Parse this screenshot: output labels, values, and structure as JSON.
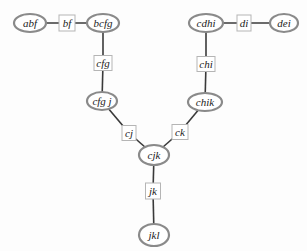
{
  "diagram": {
    "type": "junction-tree",
    "clusters": [
      {
        "id": "abf",
        "label": "abf",
        "cx": 30,
        "cy": 23,
        "rx": 16,
        "ry": 9
      },
      {
        "id": "bcfg",
        "label": "bcfg",
        "cx": 103,
        "cy": 23,
        "rx": 16,
        "ry": 9
      },
      {
        "id": "cdhi",
        "label": "cdhi",
        "cx": 206,
        "cy": 23,
        "rx": 17,
        "ry": 9
      },
      {
        "id": "dei",
        "label": "dei",
        "cx": 284,
        "cy": 23,
        "rx": 14,
        "ry": 9
      },
      {
        "id": "cfgj",
        "label": "cfg j",
        "cx": 102,
        "cy": 101,
        "rx": 15,
        "ry": 9
      },
      {
        "id": "chik",
        "label": "chik",
        "cx": 205,
        "cy": 102,
        "rx": 17,
        "ry": 9
      },
      {
        "id": "cjk",
        "label": "cjk",
        "cx": 154,
        "cy": 155,
        "rx": 15,
        "ry": 10
      },
      {
        "id": "jkl",
        "label": "jkl",
        "cx": 154,
        "cy": 235,
        "rx": 15,
        "ry": 11
      }
    ],
    "separators": [
      {
        "id": "bf",
        "label": "bf",
        "cx": 67,
        "cy": 23,
        "w": 16,
        "h": 16
      },
      {
        "id": "cfg",
        "label": "cfg",
        "cx": 103,
        "cy": 63,
        "w": 18,
        "h": 15
      },
      {
        "id": "di",
        "label": "di",
        "cx": 244,
        "cy": 23,
        "w": 14,
        "h": 16
      },
      {
        "id": "chi",
        "label": "chi",
        "cx": 206,
        "cy": 64,
        "w": 18,
        "h": 15
      },
      {
        "id": "cj",
        "label": "cj",
        "cx": 129,
        "cy": 133,
        "w": 14,
        "h": 15
      },
      {
        "id": "ck",
        "label": "ck",
        "cx": 180,
        "cy": 132,
        "w": 16,
        "h": 15
      },
      {
        "id": "jk",
        "label": "jk",
        "cx": 153,
        "cy": 191,
        "w": 15,
        "h": 16
      }
    ],
    "edges": [
      {
        "from": "abf",
        "to": "bf"
      },
      {
        "from": "bf",
        "to": "bcfg"
      },
      {
        "from": "bcfg",
        "to": "cfg"
      },
      {
        "from": "cfg",
        "to": "cfgj"
      },
      {
        "from": "cdhi",
        "to": "di"
      },
      {
        "from": "di",
        "to": "dei"
      },
      {
        "from": "cdhi",
        "to": "chi"
      },
      {
        "from": "chi",
        "to": "chik"
      },
      {
        "from": "cfgj",
        "to": "cj"
      },
      {
        "from": "cj",
        "to": "cjk"
      },
      {
        "from": "chik",
        "to": "ck"
      },
      {
        "from": "ck",
        "to": "cjk"
      },
      {
        "from": "cjk",
        "to": "jk"
      },
      {
        "from": "jk",
        "to": "jkl"
      }
    ]
  }
}
